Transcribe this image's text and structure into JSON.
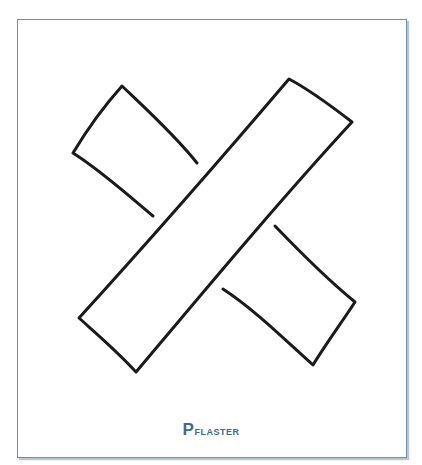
{
  "card": {
    "caption": "Pflaster",
    "caption_first": "P",
    "caption_rest": "flaster",
    "border_color": "#6f8fb0",
    "caption_color": "#3f6a96"
  },
  "illustration": {
    "subject": "two crossed adhesive bandage strips (plaster)",
    "stroke_color": "#1a1a1a"
  }
}
